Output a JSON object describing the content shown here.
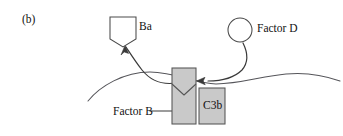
{
  "figure": {
    "panel_letter": "(b)",
    "background_color": "#ffffff",
    "stroke_color": "#3a3a3a",
    "shape_fill_color": "#c9c9c9",
    "text_color": "#111111"
  },
  "labels": {
    "ba": "Ba",
    "factor_d": "Factor D",
    "factor_b": "Factor B",
    "c3b": "C3b"
  },
  "shapes": [
    {
      "name": "ba-fragment",
      "kind": "notched-square",
      "fill": "#ffffff",
      "x": 110,
      "y": 17,
      "width": 26,
      "height": 30
    },
    {
      "name": "factor-d-circle",
      "kind": "circle",
      "fill": "#ffffff",
      "cx": 240,
      "cy": 30,
      "r": 12
    },
    {
      "name": "bb-fragment-box",
      "kind": "rect-with-v-notch",
      "fill": "#c9c9c9",
      "x": 172,
      "y": 68,
      "width": 24,
      "height": 56
    },
    {
      "name": "c3b-box",
      "kind": "rect",
      "fill": "#c9c9c9",
      "x": 199,
      "y": 88,
      "width": 26,
      "height": 36
    }
  ],
  "connectors": [
    {
      "name": "factor-b-arrow",
      "kind": "straight-arrow",
      "from": "Factor B label",
      "to": "bb-fragment-box"
    },
    {
      "name": "ba-release-arrow",
      "kind": "curved-arrow",
      "from": "complex",
      "to": "Ba"
    },
    {
      "name": "factor-d-arrow",
      "kind": "curved-arrow",
      "from": "Factor D",
      "to": "bb-fragment-box"
    },
    {
      "name": "membrane-line",
      "kind": "wavy-line",
      "from": "left",
      "to": "right"
    }
  ]
}
